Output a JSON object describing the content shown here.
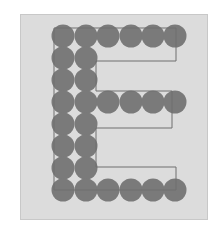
{
  "figure": {
    "letter": "E",
    "colors": {
      "background": "#ffffff",
      "panel": "#dcdcdc",
      "circle": "#7a7a7a",
      "outline": "#6e6e6e"
    },
    "grid": {
      "columns_x": [
        63,
        86,
        108,
        131,
        153,
        175
      ],
      "rows_y": [
        36,
        58,
        80,
        102,
        124,
        146,
        168,
        190
      ],
      "radius": 11.5
    },
    "rows": [
      {
        "row": 0,
        "count": 6
      },
      {
        "row": 1,
        "count": 2
      },
      {
        "row": 2,
        "count": 2
      },
      {
        "row": 3,
        "count": 6
      },
      {
        "row": 4,
        "count": 2
      },
      {
        "row": 5,
        "count": 2
      },
      {
        "row": 6,
        "count": 2
      },
      {
        "row": 7,
        "count": 6
      }
    ],
    "outline_points": "54,28 176,28 176,61 96,61 96,91 172,91 172,128 96,128 96,167 176,167 176,190 54,190"
  }
}
